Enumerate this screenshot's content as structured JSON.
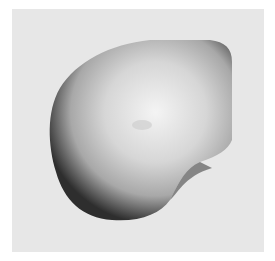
{
  "image": {
    "subject": "mother-of-pearl shell",
    "background_color": "#e7e7e7",
    "border_color": "#ffffff",
    "shell_colors": {
      "highlight": "#f2f2f2",
      "mid": "#c8c8c8",
      "edge": "#3a3a3a"
    }
  }
}
